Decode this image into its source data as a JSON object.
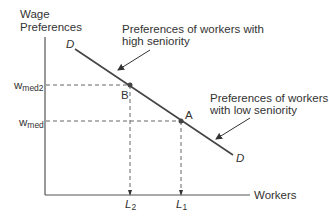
{
  "diagram": {
    "y_axis_label_line1": "Wage",
    "y_axis_label_line2": "Preferences",
    "x_axis_label": "Workers",
    "curve_label_top": "D",
    "curve_label_bottom": "D",
    "y_ticks": [
      {
        "base": "w",
        "sub": "med2"
      },
      {
        "base": "w",
        "sub": "med"
      }
    ],
    "x_ticks": [
      {
        "base": "L",
        "sub": "2"
      },
      {
        "base": "L",
        "sub": "1"
      }
    ],
    "points": [
      {
        "label": "B",
        "x": "L2",
        "y": "wmed2"
      },
      {
        "label": "A",
        "x": "L1",
        "y": "wmed"
      }
    ],
    "annotations": [
      {
        "line1": "Preferences of workers with",
        "line2": "high seniority"
      },
      {
        "line1": "Preferences of workers",
        "line2": "with low seniority"
      }
    ],
    "colors": {
      "axis": "#555555",
      "curve": "#444444",
      "dashed": "#666666",
      "text": "#333333"
    }
  }
}
